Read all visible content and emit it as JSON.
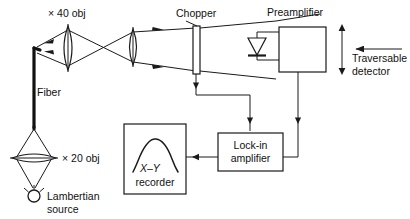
{
  "figure": {
    "type": "optical-measurement-schematic",
    "background_color": "#ffffff",
    "line_color": "#1a1a1a"
  },
  "labels": {
    "obj40": "× 40 obj",
    "obj20": "× 20 obj",
    "fiber": "Fiber",
    "lambertian_line1": "Lambertian",
    "lambertian_line2": "source",
    "chopper": "Chopper",
    "preamplifier": "Preamplifier",
    "traversable_line1": "Traversable",
    "traversable_line2": "detector",
    "lockin_line1": "Lock-in",
    "lockin_line2": "amplifier",
    "recorder_axis": "X–Y",
    "recorder_line2": "recorder"
  },
  "components": {
    "lens_40x": {
      "name": "× 40 obj",
      "kind": "objective-lens"
    },
    "lens_collimator": {
      "name": "collimating lens",
      "kind": "lens"
    },
    "lens_20x": {
      "name": "× 20 obj",
      "kind": "objective-lens"
    },
    "fiber": {
      "name": "Fiber",
      "kind": "optical-fiber"
    },
    "source": {
      "name": "Lambertian source",
      "kind": "light-source"
    },
    "chopper": {
      "name": "Chopper",
      "kind": "optical-chopper"
    },
    "photodiode": {
      "name": "photodiode",
      "kind": "detector-diode"
    },
    "preamplifier": {
      "name": "Preamplifier",
      "kind": "amplifier-box"
    },
    "lockin": {
      "name": "Lock-in amplifier",
      "kind": "amplifier-box"
    },
    "recorder": {
      "name": "X–Y recorder",
      "kind": "plotter-box"
    },
    "traversable_detector": {
      "name": "Traversable detector",
      "kind": "annotation"
    }
  },
  "signal_flow": [
    {
      "from": "Lambertian source",
      "to": "× 20 obj"
    },
    {
      "from": "× 20 obj",
      "to": "Fiber"
    },
    {
      "from": "Fiber",
      "to": "× 40 obj"
    },
    {
      "from": "× 40 obj",
      "to": "collimating lens"
    },
    {
      "from": "collimating lens",
      "to": "Chopper"
    },
    {
      "from": "Chopper",
      "to": "photodiode"
    },
    {
      "from": "photodiode",
      "to": "Preamplifier"
    },
    {
      "from": "Chopper",
      "to": "Lock-in amplifier"
    },
    {
      "from": "Preamplifier",
      "to": "Lock-in amplifier"
    },
    {
      "from": "Lock-in amplifier",
      "to": "X–Y recorder"
    }
  ]
}
